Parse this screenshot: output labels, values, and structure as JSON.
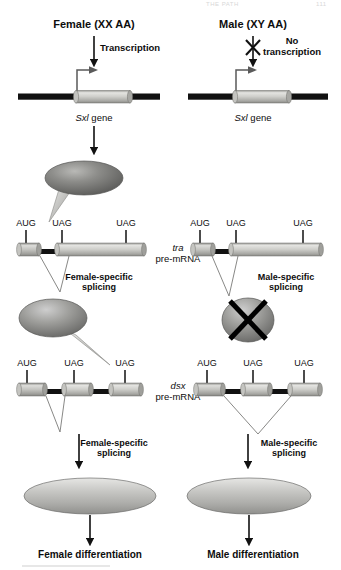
{
  "figure": {
    "title_ghost_left": "THE PATH",
    "title_ghost_right": "111",
    "organism_pathway": "Drosophila sex determination cascade"
  },
  "columns": {
    "female": {
      "header": "Female (XX AA)",
      "transcription_label": "Transcription",
      "gene_label": "Sxl gene",
      "protein1": "SXL protein",
      "splice1_label": "Female-specific\nsplicing",
      "splice1_line1": "Female-specific",
      "splice1_line2": "splicing",
      "protein2_line1": "TRA",
      "protein2_line2": "protein",
      "splice2_line1": "Female-specific",
      "splice2_line2": "splicing",
      "protein3_line1": "DSX-F",
      "protein3_line2": "Protein",
      "outcome": "Female differentiation"
    },
    "male": {
      "header": "Male (XY AA)",
      "transcription_line1": "No",
      "transcription_line2": "transcription",
      "gene_label": "Sxl gene",
      "blocked_icon": "x-blocked-arrow",
      "no_protein_icon": "x-crossed-ellipse",
      "splice1_line1": "Male-specific",
      "splice1_line2": "splicing",
      "splice2_line1": "Male-specific",
      "splice2_line2": "splicing",
      "protein3_line1": "DSX-M",
      "protein3_line2": "Protein",
      "outcome": "Male differentiation"
    }
  },
  "transcripts": {
    "tra": {
      "name_italic": "tra",
      "name_rest": "pre-mRNA"
    },
    "dsx": {
      "name_italic": "dsx",
      "name_rest": "pre-mRNA"
    }
  },
  "codons": {
    "start": "AUG",
    "stop": "UAG",
    "tra_female": [
      "AUG",
      "UAG",
      "UAG"
    ],
    "tra_male": [
      "AUG",
      "UAG",
      "UAG"
    ],
    "dsx_female": [
      "AUG",
      "UAG",
      "UAG"
    ],
    "dsx_male": [
      "AUG",
      "UAG",
      "UAG"
    ]
  },
  "colors": {
    "ink": "#0d0d0d",
    "dna_black": "#111111",
    "exon_light": "#d5d5d2",
    "exon_mid": "#b6b6b2",
    "exon_dark": "#8f8f8c",
    "protein_dark": "#6f6f6f",
    "protein_light": "#c9c9c6",
    "ghost": "#d8d8d8"
  }
}
